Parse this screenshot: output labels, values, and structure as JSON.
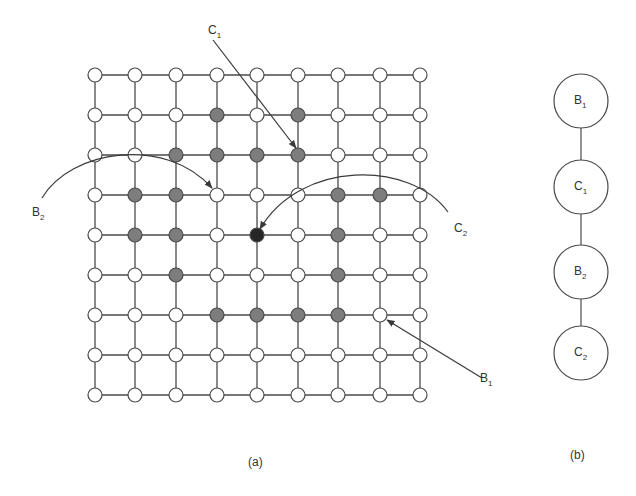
{
  "figure": {
    "panel_a": {
      "caption": "(a)",
      "grid": {
        "cols": 9,
        "rows": 9,
        "x": [
          95,
          135,
          176,
          217,
          257,
          298,
          338,
          380,
          420
        ],
        "y": [
          75,
          115,
          155,
          195,
          235,
          275,
          315,
          355,
          395
        ],
        "node_radius": 7,
        "shaded_nodes": [
          [
            1,
            3
          ],
          [
            1,
            5
          ],
          [
            2,
            2
          ],
          [
            2,
            3
          ],
          [
            2,
            4
          ],
          [
            2,
            5
          ],
          [
            3,
            1
          ],
          [
            3,
            2
          ],
          [
            3,
            6
          ],
          [
            3,
            7
          ],
          [
            4,
            1
          ],
          [
            4,
            2
          ],
          [
            4,
            6
          ],
          [
            5,
            2
          ],
          [
            5,
            6
          ],
          [
            6,
            3
          ],
          [
            6,
            4
          ],
          [
            6,
            5
          ],
          [
            6,
            6
          ]
        ],
        "dark_nodes": [
          [
            4,
            4
          ]
        ]
      },
      "annotations": [
        {
          "id": "C1",
          "label": "C",
          "sub": "1",
          "label_x": 208,
          "label_y": 34,
          "target_row": 2,
          "target_col": 5
        },
        {
          "id": "B2",
          "label": "B",
          "sub": "2",
          "label_x": 32,
          "label_y": 216,
          "target_row": 3,
          "target_col": 3
        },
        {
          "id": "C2",
          "label": "C",
          "sub": "2",
          "label_x": 454,
          "label_y": 232,
          "target_row": 4,
          "target_col": 4
        },
        {
          "id": "B1",
          "label": "B",
          "sub": "1",
          "label_x": 480,
          "label_y": 382,
          "target_row": 6,
          "target_col": 7
        }
      ]
    },
    "panel_b": {
      "caption": "(b)",
      "nodes": [
        {
          "label": "B",
          "sub": "1",
          "cy": 101
        },
        {
          "label": "C",
          "sub": "1",
          "cy": 187
        },
        {
          "label": "B",
          "sub": "2",
          "cy": 272
        },
        {
          "label": "C",
          "sub": "2",
          "cy": 353
        }
      ],
      "cx": 581,
      "r": 27
    },
    "colors": {
      "stroke": "#4a4a4a",
      "node_fill": "#ffffff",
      "shaded_fill": "#7d7d7d",
      "dark_fill": "#262626",
      "text": "#333333"
    }
  }
}
